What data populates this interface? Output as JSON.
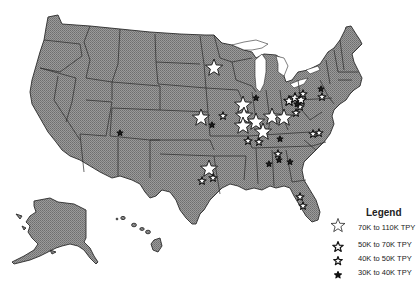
{
  "map": {
    "region": "United States",
    "insets": [
      "Alaska",
      "Hawaii"
    ],
    "colors": {
      "land": "#8c8c8c",
      "border": "#2a2a2a",
      "water": "#ffffff",
      "star_fill": "#ffffff",
      "star_stroke": "#111111"
    }
  },
  "legend": {
    "title": "Legend",
    "items": [
      {
        "label": "70K to 110K TPY",
        "size": "xlarge"
      },
      {
        "label": "50K to 70K  TPY",
        "size": "large"
      },
      {
        "label": "40K to 50K  TPY",
        "size": "medium"
      },
      {
        "label": "30K to 40K  TPY",
        "size": "small"
      }
    ]
  },
  "markers": [
    {
      "x": 214,
      "y": 68,
      "size": "xlarge",
      "approx_location": "Minnesota"
    },
    {
      "x": 201,
      "y": 118,
      "size": "xlarge",
      "approx_location": "Nebraska/Kansas"
    },
    {
      "x": 223,
      "y": 116,
      "size": "medium",
      "approx_location": "Kansas"
    },
    {
      "x": 212,
      "y": 125,
      "size": "small",
      "approx_location": "Kansas"
    },
    {
      "x": 120,
      "y": 133,
      "size": "small",
      "approx_location": "New Mexico"
    },
    {
      "x": 243,
      "y": 105,
      "size": "xlarge",
      "approx_location": "Iowa/Missouri"
    },
    {
      "x": 244,
      "y": 116,
      "size": "xlarge",
      "approx_location": "Missouri"
    },
    {
      "x": 243,
      "y": 126,
      "size": "xlarge",
      "approx_location": "Missouri"
    },
    {
      "x": 256,
      "y": 122,
      "size": "xlarge",
      "approx_location": "Illinois"
    },
    {
      "x": 263,
      "y": 132,
      "size": "xlarge",
      "approx_location": "Illinois/Kentucky"
    },
    {
      "x": 248,
      "y": 141,
      "size": "medium",
      "approx_location": "Missouri/Arkansas"
    },
    {
      "x": 259,
      "y": 142,
      "size": "medium",
      "approx_location": "Missouri"
    },
    {
      "x": 272,
      "y": 117,
      "size": "xlarge",
      "approx_location": "Indiana"
    },
    {
      "x": 284,
      "y": 118,
      "size": "xlarge",
      "approx_location": "Ohio"
    },
    {
      "x": 296,
      "y": 113,
      "size": "medium",
      "approx_location": "Ohio"
    },
    {
      "x": 300,
      "y": 107,
      "size": "medium",
      "approx_location": "Ohio"
    },
    {
      "x": 256,
      "y": 98,
      "size": "small",
      "approx_location": "Illinois"
    },
    {
      "x": 289,
      "y": 101,
      "size": "large",
      "approx_location": "Ohio/Pennsylvania"
    },
    {
      "x": 295,
      "y": 98,
      "size": "large",
      "approx_location": "Pennsylvania"
    },
    {
      "x": 301,
      "y": 100,
      "size": "large",
      "approx_location": "Pennsylvania"
    },
    {
      "x": 303,
      "y": 94,
      "size": "medium",
      "approx_location": "Pennsylvania"
    },
    {
      "x": 297,
      "y": 104,
      "size": "small",
      "approx_location": "Pennsylvania"
    },
    {
      "x": 321,
      "y": 89,
      "size": "small",
      "approx_location": "Pennsylvania"
    },
    {
      "x": 322,
      "y": 97,
      "size": "medium",
      "approx_location": "Pennsylvania"
    },
    {
      "x": 319,
      "y": 133,
      "size": "medium",
      "approx_location": "North Carolina"
    },
    {
      "x": 313,
      "y": 134,
      "size": "medium",
      "approx_location": "Virginia/NC"
    },
    {
      "x": 280,
      "y": 139,
      "size": "small",
      "approx_location": "Tennessee"
    },
    {
      "x": 278,
      "y": 154,
      "size": "medium",
      "approx_location": "Alabama"
    },
    {
      "x": 279,
      "y": 160,
      "size": "small",
      "approx_location": "Alabama"
    },
    {
      "x": 269,
      "y": 164,
      "size": "small",
      "approx_location": "Mississippi/Alabama"
    },
    {
      "x": 290,
      "y": 162,
      "size": "small",
      "approx_location": "Georgia"
    },
    {
      "x": 209,
      "y": 169,
      "size": "xlarge",
      "approx_location": "Texas"
    },
    {
      "x": 202,
      "y": 181,
      "size": "medium",
      "approx_location": "Texas"
    },
    {
      "x": 213,
      "y": 178,
      "size": "medium",
      "approx_location": "Texas"
    },
    {
      "x": 300,
      "y": 197,
      "size": "medium",
      "approx_location": "Florida"
    },
    {
      "x": 303,
      "y": 206,
      "size": "medium",
      "approx_location": "Florida"
    }
  ]
}
